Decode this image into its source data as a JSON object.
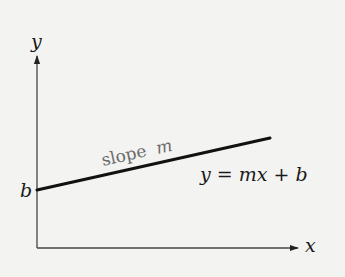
{
  "diagram": {
    "axes": {
      "x_label": "x",
      "y_label": "y"
    },
    "labels": {
      "intercept": "b",
      "slope_word": "slope",
      "slope_var": "m",
      "equation_y": "y",
      "equation_eq": " = ",
      "equation_mx": "mx",
      "equation_plus": " + ",
      "equation_b": "b"
    },
    "colors": {
      "background": "#f3f3f2",
      "axis": "#333333",
      "line": "#111111",
      "slope_text": "#6b6b6b"
    },
    "geometry": {
      "origin": [
        37,
        248
      ],
      "x_axis_end": [
        299,
        248
      ],
      "y_axis_end": [
        37,
        55
      ],
      "line_start": [
        37,
        190
      ],
      "line_end": [
        270,
        138
      ]
    }
  }
}
